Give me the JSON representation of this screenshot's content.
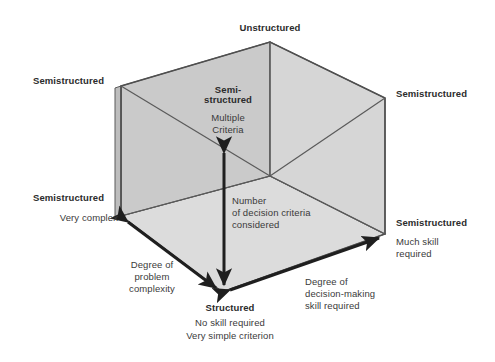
{
  "diagram": {
    "colors": {
      "face_front": "#d2d2d2",
      "face_left": "#cbcbcb",
      "face_floor": "#dcdcdc",
      "face_top": "#e2e2e2",
      "edge": "#4f4f4f",
      "arrow": "#1f1f1f",
      "text": "#3a3a3a",
      "text_bold": "#2b2b2b",
      "background": "#ffffff"
    },
    "labels": {
      "top_apex": "Unstructured",
      "left_top": "Semistructured",
      "right_top": "Semistructured",
      "left_bottom_title": "Semistructured",
      "left_bottom_sub": "Very complex",
      "right_bottom_title": "Semistructured",
      "right_bottom_sub_line1": "Much skill",
      "right_bottom_sub_line2": "required",
      "center_title_line1": "Semi-",
      "center_title_line2": "structured",
      "center_sub_line1": "Multiple",
      "center_sub_line2": "Criteria",
      "vertical_axis_line1": "Number",
      "vertical_axis_line2": "of decision criteria",
      "vertical_axis_line3": "considered",
      "left_axis_line1": "Degree of",
      "left_axis_line2": "problem",
      "left_axis_line3": "complexity",
      "right_axis_line1": "Degree of",
      "right_axis_line2": "decision-making",
      "right_axis_line3": "skill required",
      "bottom_title": "Structured",
      "bottom_sub_line1": "No skill required",
      "bottom_sub_line2": "Very simple criterion"
    }
  }
}
